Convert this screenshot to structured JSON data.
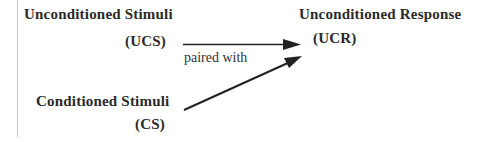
{
  "diagram": {
    "ucs": {
      "name": "Unconditioned  Stimuli",
      "abbr": "(UCS)"
    },
    "cs": {
      "name": "Conditioned  Stimuli",
      "abbr": "(CS)"
    },
    "ucr": {
      "name": "Unconditioned Response",
      "abbr": "(UCR)"
    },
    "edge_label": "paired with",
    "edges": [
      {
        "from": "UCS",
        "to": "UCR"
      },
      {
        "from": "CS",
        "to": "UCR"
      }
    ],
    "colors": {
      "text": "#2a2a2a",
      "arrow": "#222222",
      "border": "#c8c8c8"
    }
  }
}
